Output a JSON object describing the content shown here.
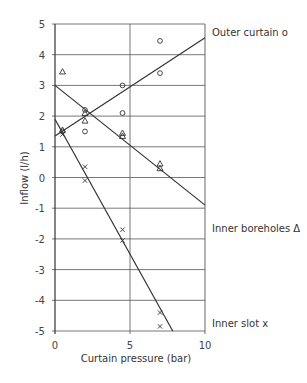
{
  "chart_data": {
    "type": "scatter",
    "title": "",
    "xlabel": "Curtain pressure (bar)",
    "ylabel": "Inflow (l/h)",
    "xlim": [
      0,
      10
    ],
    "ylim": [
      -5,
      5
    ],
    "x_ticks": [
      "0",
      "5",
      "10"
    ],
    "y_ticks": [
      "5",
      "4",
      "3",
      "2",
      "1",
      "0",
      "-1",
      "-2",
      "-3",
      "-4",
      "-5"
    ],
    "grid": true,
    "legend_position": "right, inline labels",
    "series": [
      {
        "name": "Outer curtain",
        "marker": "circle",
        "marker_glyph": "o",
        "points": [
          [
            0.5,
            1.5
          ],
          [
            2.0,
            2.2
          ],
          [
            2.0,
            1.5
          ],
          [
            4.5,
            3.0
          ],
          [
            4.5,
            2.1
          ],
          [
            7.0,
            4.45
          ],
          [
            7.0,
            3.4
          ]
        ],
        "fit_line": [
          [
            0,
            1.35
          ],
          [
            10,
            4.55
          ]
        ]
      },
      {
        "name": "Inner boreholes",
        "marker": "triangle",
        "marker_glyph": "Δ",
        "points": [
          [
            0.5,
            3.45
          ],
          [
            0.5,
            1.55
          ],
          [
            2.0,
            2.1
          ],
          [
            2.0,
            1.85
          ],
          [
            4.5,
            1.45
          ],
          [
            4.5,
            1.35
          ],
          [
            7.0,
            0.45
          ],
          [
            7.0,
            0.3
          ]
        ],
        "fit_line": [
          [
            0,
            3.0
          ],
          [
            10,
            -0.9
          ]
        ]
      },
      {
        "name": "Inner slot",
        "marker": "cross",
        "marker_glyph": "x",
        "points": [
          [
            0.5,
            1.4
          ],
          [
            2.0,
            0.35
          ],
          [
            2.0,
            -0.1
          ],
          [
            4.5,
            -1.7
          ],
          [
            4.5,
            -2.05
          ],
          [
            7.0,
            -4.4
          ],
          [
            7.0,
            -4.85
          ]
        ],
        "fit_line": [
          [
            0,
            1.9
          ],
          [
            7.85,
            -5
          ]
        ]
      }
    ]
  },
  "labels": {
    "xlabel": "Curtain pressure (bar)",
    "ylabel": "Inflow (l/h)",
    "series_outer": "Outer curtain o",
    "series_boreholes": "Inner boreholes Δ",
    "series_slot": "Inner slot x"
  },
  "colors": {
    "ink": "#333333",
    "grid": "#555555",
    "background": "#ffffff"
  }
}
